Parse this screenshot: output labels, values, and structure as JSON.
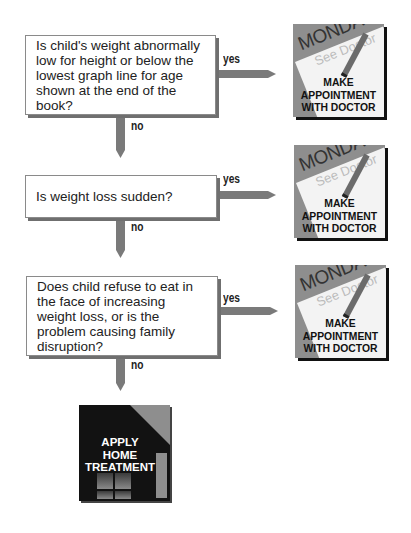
{
  "questions": [
    {
      "text": "Is child's weight abnormally low for height or below the lowest graph line for age shown at the end of the book?"
    },
    {
      "text": "Is weight loss sudden?"
    },
    {
      "text": "Does child refuse to eat in the face of increasing weight loss, or is the problem causing family disruption?"
    }
  ],
  "labels": {
    "yes": "yes",
    "no": "no"
  },
  "doctor_card": {
    "day": "MONDAY",
    "note": "See Doctor",
    "action_line1": "MAKE",
    "action_line2": "APPOINTMENT",
    "action_line3": "WITH DOCTOR"
  },
  "home_card": {
    "line1": "APPLY",
    "line2": "HOME",
    "line3": "TREATMENT"
  },
  "colors": {
    "arrow": "#7a7a7a",
    "card_bg": "#8e8e8e",
    "home_bg": "#121212"
  }
}
